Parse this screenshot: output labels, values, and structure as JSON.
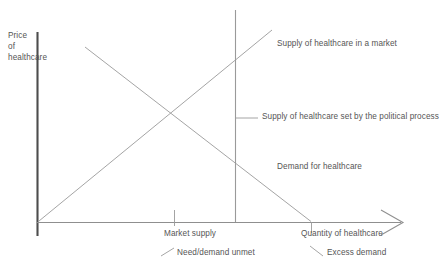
{
  "figure": {
    "kind": "economics-supply-demand-diagram",
    "background_color": "#ffffff",
    "line_color": "#8c8c8c",
    "axis_color": "#555555",
    "text_color": "#555555"
  },
  "axes": {
    "y_axis": {
      "name": "price-axis",
      "label": "Price\nof\nhealthcare",
      "label_line1": "Price",
      "label_line2": "of",
      "label_line3": "healthcare"
    },
    "x_axis": {
      "name": "quantity-axis",
      "label": "Quantity of healthcare",
      "has_arrowhead": true
    }
  },
  "curves": [
    {
      "name": "supply-of-healthcare-in-a-market",
      "label": "Supply of healthcare in a market",
      "slope": "upward"
    },
    {
      "name": "supply-of-healthcare-set-by-political-process",
      "label": "Supply of healthcare set by the political process",
      "slope": "vertical"
    },
    {
      "name": "demand-for-healthcare",
      "label": "Demand for healthcare",
      "slope": "downward"
    }
  ],
  "annotations": [
    {
      "name": "market-supply",
      "label": "Market supply"
    },
    {
      "name": "need-demand-unmet",
      "label": "Need/demand unmet"
    },
    {
      "name": "excess-demand",
      "label": "Excess demand"
    }
  ],
  "labels": {
    "price_axis_l1": "Price",
    "price_axis_l2": "of",
    "price_axis_l3": "healthcare",
    "supply_market": "Supply of healthcare in a market",
    "supply_political": "Supply of healthcare set by the political process",
    "demand": "Demand for healthcare",
    "quantity_axis": "Quantity of healthcare",
    "market_supply": "Market supply",
    "need_unmet": "Need/demand unmet",
    "excess_demand": "Excess demand"
  }
}
